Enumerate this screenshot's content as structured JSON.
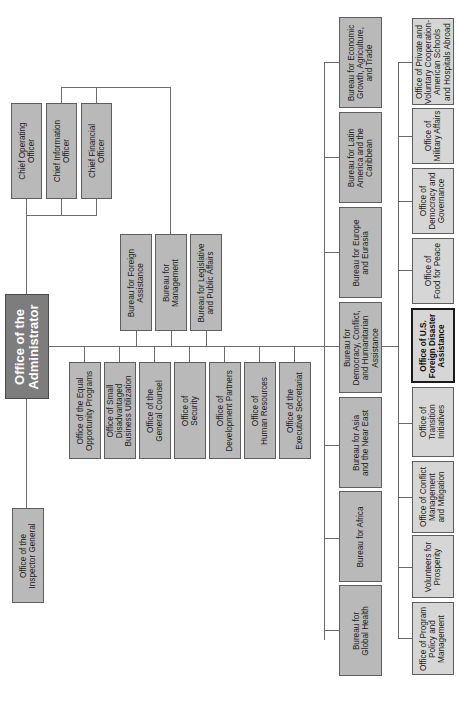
{
  "chart_title": "Office of the Administrator",
  "colors": {
    "box_fill": "#b9b9b9",
    "box_fill_light": "#d6d6d6",
    "admin_fill": "#7d7d7d",
    "highlight_border": "#1a1a1a",
    "line": "#6b6b6b"
  },
  "administrator": {
    "label": "Office of the\nAdministrator"
  },
  "inspector_general": {
    "label": "Office of the\nInspector General"
  },
  "chief_officers": [
    {
      "label": "Chief Operating\nOfficer"
    },
    {
      "label": "Chief Information\nOfficer"
    },
    {
      "label": "Chief Financial\nOfficer"
    }
  ],
  "upper_bureaus": [
    {
      "label": "Bureau for Foreign\nAssistance"
    },
    {
      "label": "Bureau for\nManagement"
    },
    {
      "label": "Bureau for Legislative\nand Public Affairs"
    }
  ],
  "staff_offices": [
    {
      "label": "Office of the Equal\nOpportunity Programs"
    },
    {
      "label": "Office of Small\nDisadvantaged\nBusiness Utilization"
    },
    {
      "label": "Office of the\nGeneral Counsel"
    },
    {
      "label": "Office of\nSecurity"
    },
    {
      "label": "Office of\nDevelopment Partners"
    },
    {
      "label": "Office of\nHuman Resources"
    },
    {
      "label": "Office of the\nExecutive Secretariat"
    }
  ],
  "bureaus": [
    {
      "label": "Bureau for Economic\nGrowth, Agriculture,\nand Trade"
    },
    {
      "label": "Bureau for Latin\nAmerica and the\nCaribbean"
    },
    {
      "label": "Bureau for Europe\nand Eurasia"
    },
    {
      "label": "Bureau for\nDemocracy, Conflict,\nand Humanitarian\nAssistance"
    },
    {
      "label": "Bureau for Asia\nand the Near East"
    },
    {
      "label": "Bureau for Africa"
    },
    {
      "label": "Bureau for\nGlobal Health"
    }
  ],
  "dcha_offices": [
    {
      "label": "Office of Private and\nVoluntary Cooperation-\nAmerican Schools\nand Hospitals Abroad"
    },
    {
      "label": "Office of\nMilitary Affairs"
    },
    {
      "label": "Office of\nDemocracy and\nGovernance"
    },
    {
      "label": "Office of\nFood for Peace"
    },
    {
      "label": "Office of U.S.\nForeign Disaster\nAssistance"
    },
    {
      "label": "Office of\nTransition\nInitiatives"
    },
    {
      "label": "Office of Conflict\nManagement\nand Mitigation"
    },
    {
      "label": "Volunteers for\nProsperity"
    },
    {
      "label": "Office of Program\nPolicy and\nManagement"
    }
  ]
}
